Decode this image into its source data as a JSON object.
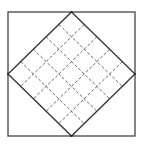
{
  "diagram": {
    "canvas": {
      "width": 145,
      "height": 144
    },
    "outer_square": {
      "x": 8,
      "y": 12,
      "width": 127,
      "height": 124,
      "stroke": "#444444"
    },
    "diamond": {
      "vertices": {
        "top": [
          71.5,
          12
        ],
        "right": [
          135,
          74
        ],
        "bottom": [
          71.5,
          136
        ],
        "left": [
          8,
          74
        ]
      },
      "stroke": "#333333"
    },
    "grid": {
      "divisions": 5,
      "style": "dashed",
      "stroke": "#555555"
    }
  }
}
